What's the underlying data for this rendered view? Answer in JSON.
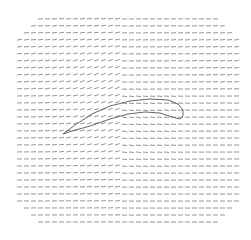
{
  "chart_data": {
    "type": "quiver",
    "title": "",
    "xlabel": "",
    "ylabel": "",
    "grid": false,
    "legend": null,
    "field": {
      "x_start": 17,
      "x_end": 235,
      "y_start": 19,
      "y_end": 222,
      "spacing": 7,
      "arrow_length": 5,
      "color": "#8a8a8a"
    },
    "airfoil": {
      "leading_edge": [
        63,
        134
      ],
      "trailing_edge_region": [
        183,
        117
      ],
      "outline_color": "#555555",
      "upper_surface": [
        [
          63,
          134
        ],
        [
          75,
          125
        ],
        [
          92,
          114
        ],
        [
          110,
          106
        ],
        [
          130,
          101
        ],
        [
          150,
          99
        ],
        [
          168,
          100
        ],
        [
          178,
          104
        ],
        [
          183,
          110
        ],
        [
          183,
          116
        ],
        [
          180,
          119
        ]
      ],
      "lower_surface": [
        [
          180,
          119
        ],
        [
          172,
          117
        ],
        [
          160,
          113
        ],
        [
          145,
          112
        ],
        [
          128,
          114
        ],
        [
          110,
          119
        ],
        [
          90,
          126
        ],
        [
          72,
          131
        ],
        [
          63,
          134
        ]
      ]
    }
  }
}
